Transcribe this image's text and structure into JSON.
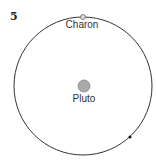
{
  "figure": {
    "number": "5",
    "orbit": {
      "cx": 83,
      "cy": 86,
      "r": 69,
      "stroke": "#333333"
    },
    "pluto": {
      "label": "Pluto",
      "cx": 84,
      "cy": 86,
      "r": 6,
      "fill": "#aaaaaa",
      "stroke": "#888888"
    },
    "charon": {
      "label": "Charon",
      "cx": 83,
      "cy": 17,
      "r": 2.5,
      "fill": "#dddddd",
      "stroke": "#666666"
    },
    "marker": {
      "cx": 130,
      "cy": 137,
      "r": 1.5,
      "fill": "#111111"
    }
  }
}
